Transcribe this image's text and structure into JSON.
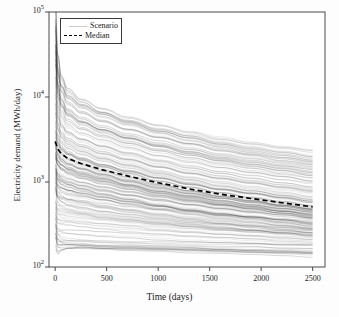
{
  "chart_data": {
    "type": "line",
    "title": "",
    "subtitle": "",
    "xlabel": "Time (days)",
    "ylabel": "Electricity demand (MWh/day)",
    "yscale": "log",
    "xscale": "linear",
    "xlim": [
      -60,
      2620
    ],
    "ylim": [
      100,
      100000
    ],
    "xticks": [
      0,
      500,
      1000,
      1500,
      2000,
      2500
    ],
    "xtick_labels": [
      "0",
      "500",
      "1000",
      "1500",
      "2000",
      "2500"
    ],
    "yticks": [
      100,
      1000,
      10000,
      100000
    ],
    "ytick_labels": [
      "10²",
      "10³",
      "10⁴",
      "10⁵"
    ],
    "ytick_mantissas": [
      "10",
      "10",
      "10",
      "10"
    ],
    "ytick_exponents": [
      "2",
      "3",
      "4",
      "5"
    ],
    "grid": false,
    "legend_position": "upper left",
    "legend_entries": [
      {
        "label": "Scenario",
        "style": "solid",
        "color": "#c9c9c9"
      },
      {
        "label": "Median",
        "style": "dashed",
        "color": "#000000"
      }
    ],
    "n_scenarios": 200,
    "scenario_color": "#2b2b2b",
    "scenario_alpha": 0.16,
    "median_color": "#000000",
    "x": [
      0,
      25,
      60,
      120,
      250,
      450,
      700,
      1000,
      1300,
      1600,
      1900,
      2200,
      2500
    ],
    "series": [
      {
        "name": "Median",
        "style": "dashed",
        "values": [
          3000,
          2450,
          2150,
          1900,
          1650,
          1400,
          1180,
          980,
          830,
          720,
          640,
          570,
          510
        ]
      }
    ],
    "envelope": {
      "upper": [
        35000,
        14000,
        11000,
        9500,
        8000,
        6600,
        5400,
        4400,
        3700,
        3150,
        2750,
        2450,
        2200
      ],
      "lower": [
        700,
        330,
        250,
        215,
        195,
        180,
        172,
        165,
        160,
        156,
        152,
        149,
        146
      ]
    },
    "bundle_note": "Dense spaghetti bundle of scenario trajectories decaying monotonically on a log scale from a narrow origin at t=0 toward ~200-2000 MWh/day at t=2500"
  }
}
